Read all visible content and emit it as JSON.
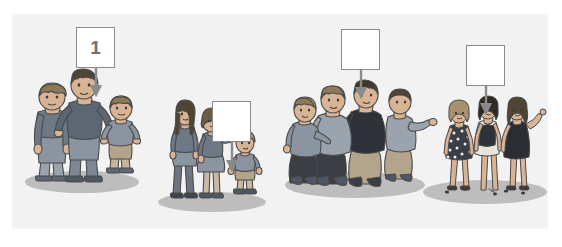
{
  "figure": {
    "panel": {
      "background_color": "#f2f2f2",
      "border_radius": 3
    },
    "colors": {
      "panel_bg": "#f2f2f2",
      "page_bg": "#ffffff",
      "box_border": "#8a8a8a",
      "box_fill": "#ffffff",
      "box_text": "#6f6f6f",
      "arrow": "#8a8a8a",
      "shadow_oval": "#b9b9b9",
      "outline": "#4a4a4a",
      "skin": "#d8b394",
      "skin_shadow": "#c29a79",
      "hair_dark": "#4d4336",
      "hair_light": "#a9916f",
      "blue_gray": "#7b8694",
      "slate": "#5d6673",
      "tan": "#b4a48c",
      "dark_navy": "#2e3138",
      "dress_dark": "#30323a",
      "olive": "#8d8a6f"
    },
    "callouts": [
      {
        "id": "callout-1",
        "label": "1",
        "box": {
          "x": 76,
          "y": 27,
          "w": 39,
          "h": 41
        },
        "arrow": {
          "x": 96,
          "y_start": 68,
          "y_end": 95
        },
        "points_to": "group-1"
      },
      {
        "id": "callout-2",
        "label": "",
        "box": {
          "x": 212,
          "y": 101,
          "w": 39,
          "h": 41
        },
        "arrow": {
          "x": 232,
          "y_start": 142,
          "y_end": 170
        },
        "points_to": "group-2"
      },
      {
        "id": "callout-3",
        "label": "",
        "box": {
          "x": 341,
          "y": 29,
          "w": 39,
          "h": 41
        },
        "arrow": {
          "x": 361,
          "y_start": 70,
          "y_end": 97
        },
        "points_to": "group-3"
      },
      {
        "id": "callout-4",
        "label": "",
        "box": {
          "x": 466,
          "y": 45,
          "w": 39,
          "h": 41
        },
        "arrow": {
          "x": 486,
          "y_start": 86,
          "y_end": 113
        },
        "points_to": "group-4"
      }
    ],
    "groups": [
      {
        "id": "group-1",
        "name": "three-men-group",
        "description": "Three male figures standing: a boy, a tall man with hands on hips, and a smaller boy in shorts",
        "member_count": 3,
        "shadow": {
          "cx": 82,
          "cy": 182,
          "rx": 57,
          "ry": 11
        }
      },
      {
        "id": "group-2",
        "name": "two-women-and-child-group",
        "description": "A tall thin woman, a woman in a skirt waving, and a small child",
        "member_count": 3,
        "shadow": {
          "cx": 212,
          "cy": 202,
          "rx": 54,
          "ry": 10
        }
      },
      {
        "id": "group-3",
        "name": "heavy-set-group",
        "description": "Four overweight figures standing close together",
        "member_count": 4,
        "shadow": {
          "cx": 355,
          "cy": 185,
          "rx": 70,
          "ry": 13
        }
      },
      {
        "id": "group-4",
        "name": "slim-women-group",
        "description": "Three slim fashionable women in dresses standing on a spotted surface",
        "member_count": 3,
        "shadow": {
          "cx": 485,
          "cy": 192,
          "rx": 62,
          "ry": 12
        }
      }
    ]
  }
}
